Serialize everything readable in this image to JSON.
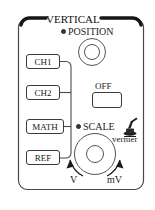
{
  "panel": {
    "title": "VERTICAL",
    "accent_color": "#1b1b1b",
    "border_color": "#3b3b3b",
    "background_color": "#ffffff"
  },
  "position_section": {
    "label": "POSITION",
    "led_icon": "led-indicator-icon",
    "knob_icon": "rotary-knob-icon"
  },
  "channel_buttons": [
    {
      "label": "CH1",
      "name": "ch1"
    },
    {
      "label": "CH2",
      "name": "ch2"
    },
    {
      "label": "MATH",
      "name": "math"
    },
    {
      "label": "REF",
      "name": "ref"
    }
  ],
  "off_button": {
    "label": "OFF"
  },
  "scale_section": {
    "label": "SCALE",
    "led_icon": "led-indicator-icon",
    "knob_icon": "rotary-knob-icon",
    "vernier_label": "vernier",
    "vernier_icon": "press-knob-icon",
    "arrow_left_label": "V",
    "arrow_right_label": "mV"
  }
}
